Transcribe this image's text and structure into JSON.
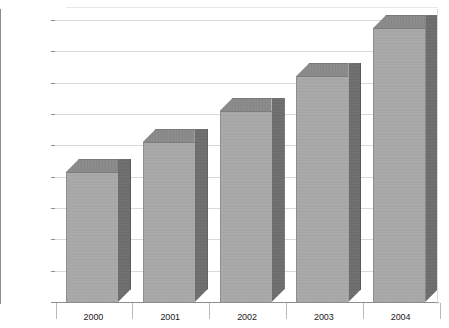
{
  "chart_data": {
    "type": "bar",
    "title": "",
    "subtitle": "",
    "xlabel": "",
    "ylabel": "",
    "categories": [
      "2000",
      "2001",
      "2002",
      "2003",
      "2004"
    ],
    "values": [
      207,
      255,
      305,
      360,
      437
    ],
    "value_prefix": "$",
    "ylim": [
      0,
      450
    ],
    "ytick_step": 50,
    "ytick_labels": [
      "$450",
      "$400",
      "$350",
      "$300",
      "$250",
      "$200",
      "$150",
      "$100",
      "$50",
      "$0"
    ],
    "ytick_values": [
      450,
      400,
      350,
      300,
      250,
      200,
      150,
      100,
      50,
      0
    ],
    "grid": true,
    "grid_orientation": "horizontal",
    "legend": false,
    "legend_position": "none",
    "series": [
      {
        "name": "",
        "values": [
          207,
          255,
          305,
          360,
          437
        ]
      }
    ],
    "style": {
      "three_d": true,
      "bar_front_color": "#a9a9a9",
      "bar_side_color": "#6f6f6f",
      "bar_top_color": "#8a8a8a",
      "gridline_color": "#d9d9d9",
      "axis_color": "#8d8d8d",
      "background_color": "#ffffff",
      "text_color": "#1a1a1a"
    }
  }
}
